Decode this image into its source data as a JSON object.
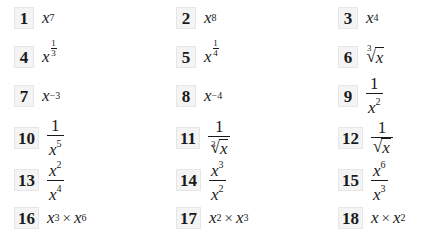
{
  "problems": [
    {
      "number": "1",
      "kind": "power",
      "base": "x",
      "exponent": "7"
    },
    {
      "number": "2",
      "kind": "power",
      "base": "x",
      "exponent": "8"
    },
    {
      "number": "3",
      "kind": "power",
      "base": "x",
      "exponent": "4"
    },
    {
      "number": "4",
      "kind": "fractional-power",
      "base": "x",
      "exp_numerator": "1",
      "exp_denominator": "3"
    },
    {
      "number": "5",
      "kind": "fractional-power",
      "base": "x",
      "exp_numerator": "1",
      "exp_denominator": "4"
    },
    {
      "number": "6",
      "kind": "root",
      "index": "3",
      "radicand": "x"
    },
    {
      "number": "7",
      "kind": "power",
      "base": "x",
      "exponent": "−3"
    },
    {
      "number": "8",
      "kind": "power",
      "base": "x",
      "exponent": "−4"
    },
    {
      "number": "9",
      "kind": "reciprocal-power",
      "numerator": "1",
      "base": "x",
      "exponent": "2"
    },
    {
      "number": "10",
      "kind": "reciprocal-power",
      "numerator": "1",
      "base": "x",
      "exponent": "5"
    },
    {
      "number": "11",
      "kind": "reciprocal-root",
      "numerator": "1",
      "index": "3",
      "radicand": "x"
    },
    {
      "number": "12",
      "kind": "reciprocal-root",
      "numerator": "1",
      "index": "",
      "radicand": "x"
    },
    {
      "number": "13",
      "kind": "quotient",
      "num_base": "x",
      "num_exp": "2",
      "den_base": "x",
      "den_exp": "4"
    },
    {
      "number": "14",
      "kind": "quotient",
      "num_base": "x",
      "num_exp": "3",
      "den_base": "x",
      "den_exp": "2"
    },
    {
      "number": "15",
      "kind": "quotient",
      "num_base": "x",
      "num_exp": "6",
      "den_base": "x",
      "den_exp": "3"
    },
    {
      "number": "16",
      "kind": "product",
      "left_base": "x",
      "left_exp": "3",
      "operator": "×",
      "right_base": "x",
      "right_exp": "6"
    },
    {
      "number": "17",
      "kind": "product",
      "left_base": "x",
      "left_exp": "2",
      "operator": "×",
      "right_base": "x",
      "right_exp": "3"
    },
    {
      "number": "18",
      "kind": "product",
      "left_base": "x",
      "left_exp": "",
      "operator": "×",
      "right_base": "x",
      "right_exp": "2"
    }
  ],
  "root_symbol": "√"
}
